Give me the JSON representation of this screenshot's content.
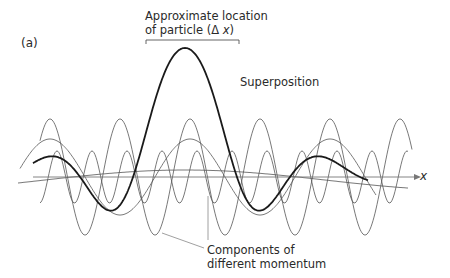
{
  "figure": {
    "panel_label": "(a)",
    "location_label": {
      "line1": "Approximate location",
      "line2_prefix": "of particle (",
      "line2_symbol": "Δ",
      "line2_var": "x",
      "line2_suffix": ")"
    },
    "superposition_label": "Superposition",
    "components_label": {
      "line1": "Components of",
      "line2": "different momentum"
    },
    "axis_label": "x",
    "colors": {
      "axis": "#777777",
      "components": "#555555",
      "superposition": "#1a1a1a",
      "text": "#2a2a2a",
      "leader": "#888888"
    }
  },
  "diagram_elements": {
    "axis": {
      "y": 177,
      "x_start": 33,
      "x_end": 414
    },
    "bracket": {
      "x_start": 146,
      "x_end": 239,
      "y": 41
    },
    "superposition_peak": {
      "x": 185,
      "y": 48
    },
    "component_waves": [
      {
        "name": "high-momentum",
        "period_px": 70,
        "amplitude_px": 58,
        "phase_peak_x": 50
      },
      {
        "name": "medium-momentum",
        "period_px": 140,
        "amplitude_px": 38,
        "phase_peak_x": 50
      },
      {
        "name": "higher-momentum",
        "period_px": 35,
        "amplitude_px": 26,
        "phase_peak_x": 57
      },
      {
        "name": "low-momentum",
        "period_px": 560,
        "amplitude_px": 10,
        "phase_peak_x": 185
      }
    ]
  }
}
